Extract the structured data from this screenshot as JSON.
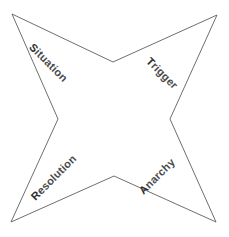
{
  "diagram": {
    "type": "four-point-star",
    "background_color": "#ffffff",
    "stroke_color": "#5d5d5d",
    "fill_color": "#ffffff",
    "label_color": "#4a4a4a",
    "initial_letter_color": "#2e2e2e",
    "canvas": {
      "width": 229,
      "height": 237
    },
    "points": "12,14 113,62 217,15 170,119 216,222 114,176 11,222 58,119",
    "vertices": [
      {
        "name": "outer-top-left",
        "x": 12,
        "y": 14
      },
      {
        "name": "inner-top",
        "x": 113,
        "y": 62
      },
      {
        "name": "outer-top-right",
        "x": 217,
        "y": 15
      },
      {
        "name": "inner-right",
        "x": 170,
        "y": 119
      },
      {
        "name": "outer-bottom-right",
        "x": 216,
        "y": 222
      },
      {
        "name": "inner-bottom",
        "x": 114,
        "y": 176
      },
      {
        "name": "outer-bottom-left",
        "x": 11,
        "y": 222
      },
      {
        "name": "inner-left",
        "x": 58,
        "y": 119
      }
    ],
    "labels": {
      "top_left": {
        "text": "Situation",
        "initial": "S",
        "rest": "ituation",
        "rotation_deg": 45
      },
      "top_right": {
        "text": "Trigger",
        "initial": "T",
        "rest": "rigger",
        "rotation_deg": 45
      },
      "bottom_left": {
        "text": "Resolution",
        "initial": "R",
        "rest": "esolution",
        "rotation_deg": -45
      },
      "bottom_right": {
        "text": "Anarchy",
        "initial": "A",
        "rest": "narchy",
        "rotation_deg": -45
      }
    }
  }
}
